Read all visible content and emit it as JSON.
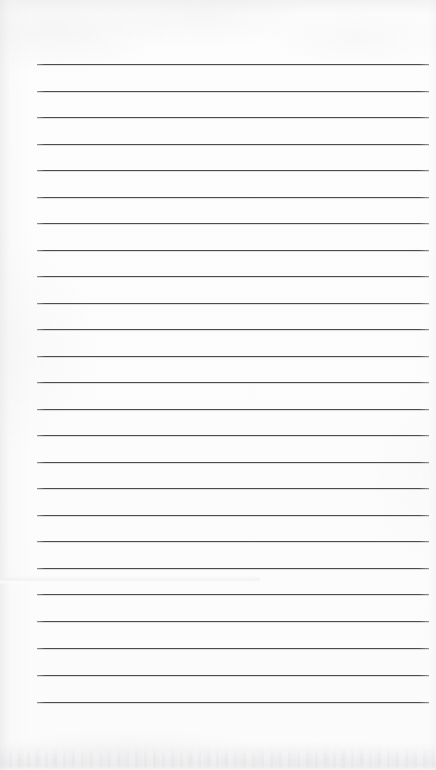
{
  "document": {
    "kind": "lined-paper-scan",
    "title": "Blank Ruled Notebook Page",
    "page_width": 436,
    "page_height": 770,
    "background_color": "#fdfdfd",
    "content_text": ""
  },
  "ruling": {
    "line_color": "#4b4b50",
    "line_thickness": 1,
    "line_count": 25,
    "left_margin_x": 37,
    "right_end_x": 429,
    "first_line_y": 64,
    "line_spacing": 26.6,
    "lines": [
      {
        "index": 1,
        "y": 64,
        "x1": 37,
        "x2": 429,
        "text": ""
      },
      {
        "index": 2,
        "y": 91,
        "x1": 37,
        "x2": 429,
        "text": ""
      },
      {
        "index": 3,
        "y": 117,
        "x1": 37,
        "x2": 429,
        "text": ""
      },
      {
        "index": 4,
        "y": 144,
        "x1": 37,
        "x2": 429,
        "text": ""
      },
      {
        "index": 5,
        "y": 170,
        "x1": 37,
        "x2": 429,
        "text": ""
      },
      {
        "index": 6,
        "y": 197,
        "x1": 37,
        "x2": 429,
        "text": ""
      },
      {
        "index": 7,
        "y": 223,
        "x1": 37,
        "x2": 429,
        "text": ""
      },
      {
        "index": 8,
        "y": 250,
        "x1": 37,
        "x2": 429,
        "text": ""
      },
      {
        "index": 9,
        "y": 276,
        "x1": 37,
        "x2": 429,
        "text": ""
      },
      {
        "index": 10,
        "y": 303,
        "x1": 37,
        "x2": 429,
        "text": ""
      },
      {
        "index": 11,
        "y": 329,
        "x1": 37,
        "x2": 429,
        "text": ""
      },
      {
        "index": 12,
        "y": 356,
        "x1": 37,
        "x2": 429,
        "text": ""
      },
      {
        "index": 13,
        "y": 382,
        "x1": 37,
        "x2": 429,
        "text": ""
      },
      {
        "index": 14,
        "y": 409,
        "x1": 37,
        "x2": 429,
        "text": ""
      },
      {
        "index": 15,
        "y": 435,
        "x1": 37,
        "x2": 429,
        "text": ""
      },
      {
        "index": 16,
        "y": 462,
        "x1": 37,
        "x2": 429,
        "text": ""
      },
      {
        "index": 17,
        "y": 488,
        "x1": 37,
        "x2": 429,
        "text": ""
      },
      {
        "index": 18,
        "y": 515,
        "x1": 37,
        "x2": 429,
        "text": ""
      },
      {
        "index": 19,
        "y": 541,
        "x1": 37,
        "x2": 429,
        "text": ""
      },
      {
        "index": 20,
        "y": 568,
        "x1": 37,
        "x2": 429,
        "text": ""
      },
      {
        "index": 21,
        "y": 594,
        "x1": 37,
        "x2": 429,
        "text": ""
      },
      {
        "index": 22,
        "y": 621,
        "x1": 37,
        "x2": 429,
        "text": ""
      },
      {
        "index": 23,
        "y": 648,
        "x1": 37,
        "x2": 429,
        "text": ""
      },
      {
        "index": 24,
        "y": 675,
        "x1": 37,
        "x2": 429,
        "text": ""
      },
      {
        "index": 25,
        "y": 702,
        "x1": 37,
        "x2": 429,
        "text": ""
      }
    ]
  },
  "artifacts": {
    "fold_crease": {
      "y": 576,
      "width": 260
    },
    "bottom_shadow_band": {
      "top": 742,
      "height": 28
    },
    "top_haze": {
      "height": 40
    }
  }
}
